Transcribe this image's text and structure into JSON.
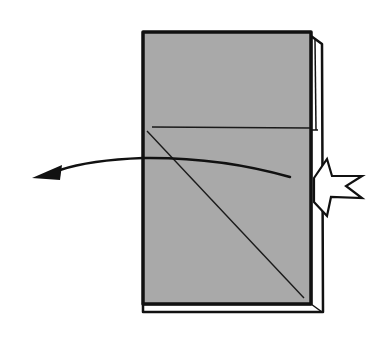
{
  "diagram": {
    "type": "origami-step",
    "colors": {
      "background": "#ffffff",
      "paper": "#a9a9a9",
      "outline": "#111111",
      "back_layer": "#ffffff"
    },
    "elements": {
      "paper_front": {
        "x": 143,
        "y": 32,
        "width": 168,
        "height": 272
      },
      "back_layer_edge": "thin white strip along the right and bottom edges",
      "horizontal_crease": {
        "y": 128
      },
      "diagonal_crease": {
        "from": [
          148,
          130
        ],
        "to": [
          305,
          298
        ]
      },
      "fold_arrow": {
        "direction": "left",
        "from": [
          290,
          177
        ],
        "to": [
          33,
          178
        ]
      },
      "push_symbol": "star-burst"
    }
  }
}
